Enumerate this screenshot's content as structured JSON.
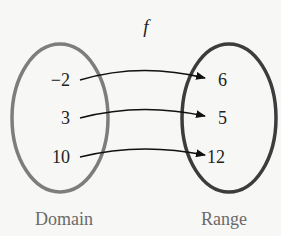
{
  "diagram": {
    "function_name": "f",
    "domain": {
      "label": "Domain",
      "values": [
        "−2",
        "3",
        "10"
      ],
      "ellipse_color": "#7a7a7a"
    },
    "range": {
      "label": "Range",
      "values": [
        "6",
        "5",
        "12"
      ],
      "ellipse_color": "#3a3a3a"
    },
    "mappings": [
      {
        "from": "−2",
        "to": "6"
      },
      {
        "from": "3",
        "to": "5"
      },
      {
        "from": "10",
        "to": "12"
      }
    ],
    "arrow_color": "#111111",
    "text_color": "#222222",
    "label_color": "#666666"
  }
}
